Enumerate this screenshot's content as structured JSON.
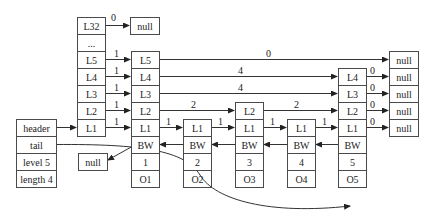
{
  "header_levels": [
    "L32",
    "...",
    "L5",
    "L4",
    "L3",
    "L2",
    "L1"
  ],
  "struct": {
    "header": "header",
    "tail": "tail",
    "level": "level 5",
    "length": "length 4"
  },
  "null_text": "null",
  "nodes": [
    {
      "levels": [
        "L5",
        "L4",
        "L3",
        "L2",
        "L1"
      ],
      "bw": "BW",
      "score": "1",
      "obj": "O1"
    },
    {
      "levels": [
        "L1"
      ],
      "bw": "BW",
      "score": "2",
      "obj": "O2"
    },
    {
      "levels": [
        "L2",
        "L1"
      ],
      "bw": "BW",
      "score": "3",
      "obj": "O3"
    },
    {
      "levels": [
        "L1"
      ],
      "bw": "BW",
      "score": "4",
      "obj": "O4"
    },
    {
      "levels": [
        "L4",
        "L3",
        "L2",
        "L1"
      ],
      "bw": "BW",
      "score": "5",
      "obj": "O5"
    }
  ],
  "spans": {
    "header_L32": "0",
    "header_L5": "1",
    "header_L4": "1",
    "header_L3": "1",
    "header_L2": "1",
    "header_L1": "1",
    "n1_L5": "0",
    "n1_L4": "4",
    "n1_L3": "4",
    "n1_L2": "2",
    "n1_L1": "1",
    "n2_L1": "1",
    "n3_L2": "2",
    "n3_L1": "1",
    "n4_L1": "1",
    "n5_L4": "0",
    "n5_L3": "0",
    "n5_L2": "0",
    "n5_L1": "0"
  }
}
